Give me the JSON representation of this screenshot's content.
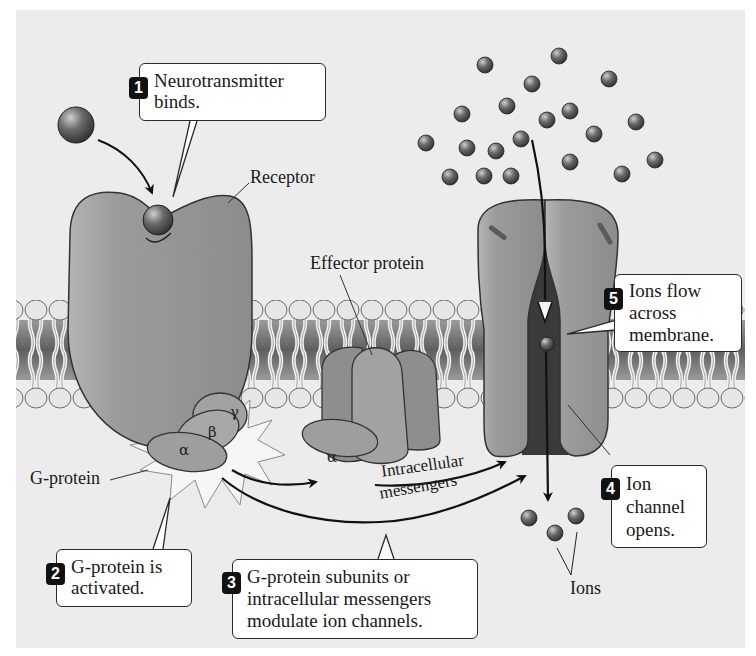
{
  "diagram": {
    "labels": {
      "receptor": "Receptor",
      "effector_protein": "Effector protein",
      "g_protein": "G-protein",
      "ions": "Ions",
      "intracellular_line1": "Intracellular",
      "intracellular_line2": "messengers"
    },
    "subunits": {
      "alpha": "α",
      "beta": "β",
      "gamma": "γ",
      "alpha_effector": "α"
    },
    "steps": [
      {
        "number": "1",
        "text": "Neurotransmitter\nbinds."
      },
      {
        "number": "2",
        "text": "G-protein is\nactivated."
      },
      {
        "number": "3",
        "text": "G-protein subunits or\nintracellular messengers\nmodulate ion channels."
      },
      {
        "number": "4",
        "text": "Ion\nchannel\nopens."
      },
      {
        "number": "5",
        "text": "Ions flow\nacross\nmembrane."
      }
    ],
    "colors": {
      "background": "#ececec",
      "protein": "#9a9a9a",
      "protein_dark": "#6e6e6e",
      "lipid_head": "#e4e4e4",
      "membrane_core": "#7a7a7a",
      "ion": "#555555",
      "starburst": "#f4f4f4"
    }
  }
}
